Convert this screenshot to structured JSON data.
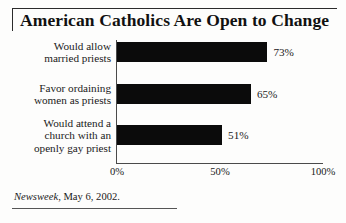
{
  "title": "American Catholics Are Open to Change",
  "source": {
    "publication": "Newsweek",
    "rest": ", May 6, 2002."
  },
  "axis": {
    "ticks": [
      "0%",
      "50%",
      "100%"
    ]
  },
  "rows": [
    {
      "label_lines": [
        "Would allow",
        "married priests"
      ],
      "value_label": "73%"
    },
    {
      "label_lines": [
        "Favor ordaining",
        "women as priests"
      ],
      "value_label": "65%"
    },
    {
      "label_lines": [
        "Would attend a",
        "church with an",
        "openly gay priest"
      ],
      "value_label": "51%"
    }
  ],
  "colors": {
    "bar": "#0b0b0b",
    "axis": "#4a4a4a",
    "text": "#1a1a1a",
    "background": "#fdfdfc"
  },
  "chart_data": {
    "type": "bar",
    "orientation": "horizontal",
    "title": "American Catholics Are Open to Change",
    "categories": [
      "Would allow married priests",
      "Favor ordaining women as priests",
      "Would attend a church with an openly gay priest"
    ],
    "values": [
      73,
      65,
      51
    ],
    "data_labels": [
      "73%",
      "65%",
      "51%"
    ],
    "xlabel": "",
    "ylabel": "",
    "xlim": [
      0,
      100
    ],
    "xticks": [
      0,
      50,
      100
    ],
    "xtick_labels": [
      "0%",
      "50%",
      "100%"
    ],
    "grid": false,
    "legend": false,
    "units": "percent",
    "source": "Newsweek, May 6, 2002."
  }
}
